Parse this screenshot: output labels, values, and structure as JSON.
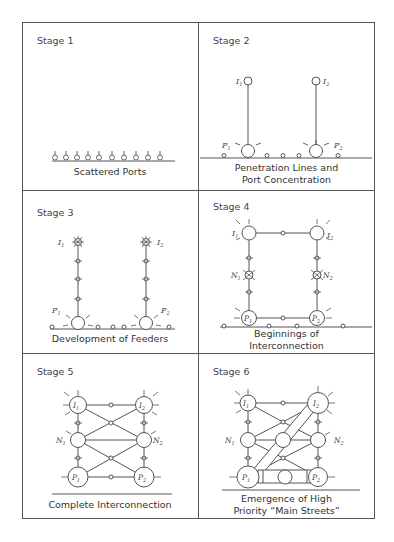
{
  "figure": {
    "panels": [
      {
        "stage": "Stage 1",
        "caption_lines": [
          "Scattered Ports"
        ]
      },
      {
        "stage": "Stage 2",
        "caption_lines": [
          "Penetration Lines and",
          "Port Concentration"
        ]
      },
      {
        "stage": "Stage 3",
        "caption_lines": [
          "Development of Feeders"
        ]
      },
      {
        "stage": "Stage 4",
        "caption_lines": [
          "Beginnings of",
          "Interconnection"
        ]
      },
      {
        "stage": "Stage 5",
        "caption_lines": [
          "Complete Interconnection"
        ]
      },
      {
        "stage": "Stage 6",
        "caption_lines": [
          "Emergence of High",
          "Priority “Main Streets”"
        ]
      }
    ],
    "node_labels": {
      "I1": "I",
      "I2": "I",
      "P1": "P",
      "P2": "P",
      "N1": "N",
      "N2": "N",
      "sub1": "1",
      "sub2": "2"
    },
    "colors": {
      "line": "#555555",
      "background": "#ffffff",
      "text": "#333333"
    }
  }
}
